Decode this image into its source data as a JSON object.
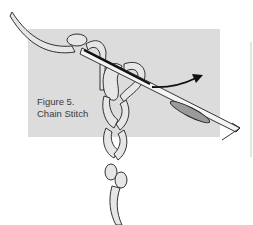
{
  "figure": {
    "label": "Figure 5.",
    "title": "Chain Stitch"
  },
  "colors": {
    "panel": "#dcdcdc",
    "thread": "#e6e6e6",
    "outline": "#1e1e1e",
    "needle": "#f4f4f4"
  },
  "elements": {
    "needle": "needle-illustration",
    "thread": "chain-stitch-thread",
    "arrow": "direction-arrow-icon"
  }
}
